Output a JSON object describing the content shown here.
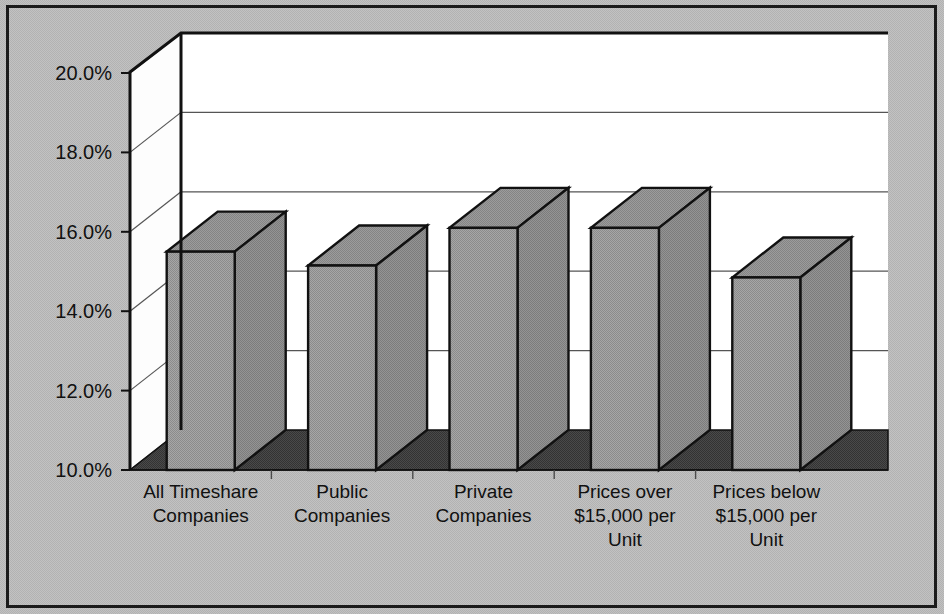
{
  "chart_data": {
    "type": "bar",
    "title": "",
    "subtitle": "",
    "xlabel": "",
    "ylabel": "",
    "categories": [
      "All Timeshare Companies",
      "Public Companies",
      "Private Companies",
      "Prices over $15,000 per Unit",
      "Prices below $15,000 per Unit"
    ],
    "category_lines": [
      [
        "All Timeshare",
        "Companies"
      ],
      [
        "Public",
        "Companies"
      ],
      [
        "Private",
        "Companies"
      ],
      [
        "Prices over",
        "$15,000 per",
        "Unit"
      ],
      [
        "Prices below",
        "$15,000 per",
        "Unit"
      ]
    ],
    "values": [
      15.5,
      15.15,
      16.1,
      16.1,
      14.85
    ],
    "value_labels": [
      "15.5%",
      "15.2%",
      "16.1%",
      "16.1%",
      "14.9%"
    ],
    "ylim": [
      10.0,
      20.0
    ],
    "yticks": [
      20.0,
      18.0,
      16.0,
      14.0,
      12.0,
      10.0
    ],
    "ytick_labels": [
      "20.0%",
      "18.0%",
      "16.0%",
      "14.0%",
      "12.0%",
      "10.0%"
    ],
    "grid": true,
    "legend": false,
    "legend_position": "none",
    "style": "3d-column",
    "colors": {
      "bar_front": "#9a9a9a",
      "bar_top": "#8d8d8d",
      "bar_side": "#828282",
      "bar_outline": "#111111",
      "plot_background": "#ffffff",
      "floor": "#444444",
      "figure_background": "#bababa",
      "gridline": "#555555",
      "frame_border": "#1a1a1a",
      "text": "#111111"
    }
  }
}
